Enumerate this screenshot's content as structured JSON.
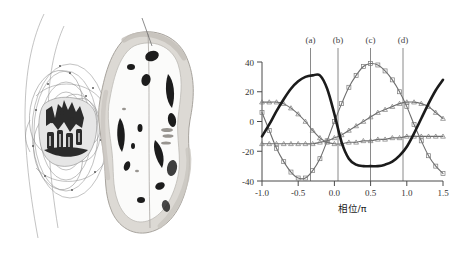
{
  "figure": {
    "title": "",
    "panels": [
      "rendering-panel",
      "chart-panel"
    ]
  },
  "left_panel": {
    "name": "scientific-rendering",
    "description": "Grayscale volumetric rendering with contour/field lines and an irregular organic iso-surface shell",
    "elements": {
      "contour_lines": "nested elliptical contour arcs",
      "core_structure": "dark clustered core",
      "shell": "irregular gray organic shell with dark voids",
      "pointer_line": "thin diagonal leader line"
    }
  },
  "chart_data": {
    "type": "line",
    "title": "",
    "xlabel": "相位/π",
    "ylabel": "百分比",
    "xlim": [
      -1.0,
      1.5
    ],
    "ylim": [
      -40,
      40
    ],
    "xticks": [
      -1.0,
      -0.5,
      0.0,
      0.5,
      1.0,
      1.5
    ],
    "xticklabels": [
      "-1.0",
      "-0.5",
      "0.0",
      "0.5",
      "1.0",
      "1.5"
    ],
    "yticks": [
      -40,
      -20,
      0,
      20,
      40
    ],
    "yticklabels": [
      "-40",
      "-20",
      "0",
      "20",
      "40"
    ],
    "grid": false,
    "legend": "none",
    "annotations": [
      {
        "label": "(a)",
        "x": -0.33
      },
      {
        "label": "(b)",
        "x": 0.05
      },
      {
        "label": "(c)",
        "x": 0.5
      },
      {
        "label": "(d)",
        "x": 0.95
      }
    ],
    "x": [
      -1.0,
      -0.9,
      -0.8,
      -0.7,
      -0.6,
      -0.5,
      -0.4,
      -0.3,
      -0.2,
      -0.1,
      0.0,
      0.1,
      0.2,
      0.3,
      0.4,
      0.5,
      0.6,
      0.7,
      0.8,
      0.9,
      1.0,
      1.1,
      1.2,
      1.3,
      1.4,
      1.5
    ],
    "series": [
      {
        "name": "series-thick",
        "style": "thick-solid",
        "marker": "none",
        "values": [
          -10,
          -2,
          7,
          15,
          22,
          27,
          30,
          31,
          31,
          22,
          5,
          -14,
          -25,
          -29,
          -30,
          -30,
          -30,
          -29,
          -27,
          -23,
          -17,
          -8,
          2,
          12,
          21,
          28
        ]
      },
      {
        "name": "series-square",
        "style": "thin-solid",
        "marker": "square",
        "values": [
          6,
          -6,
          -18,
          -27,
          -34,
          -38,
          -38,
          -33,
          -25,
          -13,
          0,
          12,
          23,
          31,
          37,
          39,
          38,
          34,
          28,
          20,
          10,
          -2,
          -13,
          -23,
          -30,
          -35
        ]
      },
      {
        "name": "series-triangle-a",
        "style": "thin-solid",
        "marker": "triangle",
        "values": [
          13,
          13,
          13,
          12,
          9,
          5,
          0,
          -6,
          -11,
          -14,
          -15,
          -15,
          -14,
          -14,
          -13,
          -13,
          -12,
          -12,
          -11,
          -11,
          -10,
          -10,
          -10,
          -10,
          -10,
          -10
        ]
      },
      {
        "name": "series-triangle-b",
        "style": "thin-solid",
        "marker": "triangle",
        "values": [
          -15,
          -15,
          -15,
          -15,
          -15,
          -15,
          -15,
          -15,
          -14,
          -13,
          -11,
          -9,
          -6,
          -3,
          0,
          3,
          6,
          8,
          10,
          12,
          13,
          13,
          12,
          10,
          6,
          2
        ]
      }
    ]
  }
}
